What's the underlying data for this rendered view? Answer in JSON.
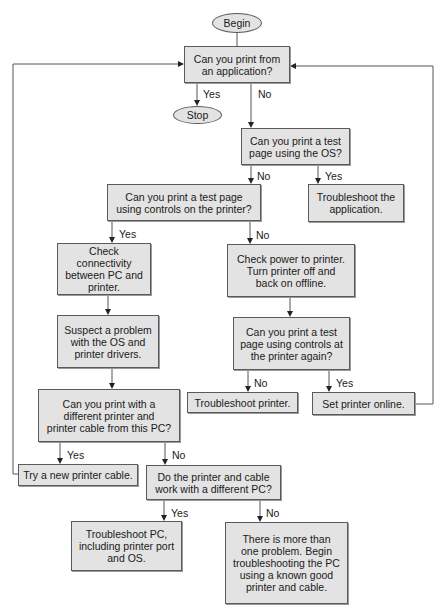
{
  "diagram": {
    "type": "flowchart",
    "colors": {
      "node_fill": "#e3e3e3",
      "node_border": "#5a5a5a",
      "line": "#555555",
      "text": "#1a1a1a"
    },
    "nodes": {
      "begin": "Begin",
      "stop": "Stop",
      "q_app": "Can you print from\nan application?",
      "q_os": "Can you print a test\npage using the OS?",
      "a_troubleshoot_app": "Troubleshoot the\napplication.",
      "q_controls": "Can you print a test page\nusing controls on the printer?",
      "a_check_connectivity": "Check connectivity\nbetween PC and\nprinter.",
      "a_check_power": "Check power to printer.\nTurn printer off and\nback on offline.",
      "a_suspect_os": "Suspect a problem\nwith the OS and\nprinter drivers.",
      "q_controls_again": "Can you print a test\npage using controls at\nthe printer again?",
      "a_troubleshoot_printer": "Troubleshoot printer.",
      "a_set_online": "Set printer online.",
      "q_diff_printer": "Can you print with a\ndifferent printer and\nprinter cable from this PC?",
      "a_new_cable": "Try a new printer cable.",
      "q_diff_pc": "Do the printer and cable\nwork with a different PC?",
      "a_troubleshoot_pc": "Troubleshoot PC,\nincluding printer port\nand OS.",
      "a_more_than_one": "There is more than\none problem. Begin\ntroubleshooting the PC\nusing a known good\nprinter and cable."
    },
    "edge_labels": {
      "app_yes": "Yes",
      "app_no": "No",
      "os_no": "No",
      "os_yes": "Yes",
      "controls_yes": "Yes",
      "controls_no": "No",
      "again_no": "No",
      "again_yes": "Yes",
      "diff_printer_yes": "Yes",
      "diff_printer_no": "No",
      "diff_pc_yes": "Yes",
      "diff_pc_no": "No"
    },
    "edges": [
      {
        "from": "begin",
        "to": "q_app"
      },
      {
        "from": "q_app",
        "to": "stop",
        "label": "Yes"
      },
      {
        "from": "q_app",
        "to": "q_os",
        "label": "No"
      },
      {
        "from": "q_os",
        "to": "q_controls",
        "label": "No"
      },
      {
        "from": "q_os",
        "to": "a_troubleshoot_app",
        "label": "Yes"
      },
      {
        "from": "q_controls",
        "to": "a_check_connectivity",
        "label": "Yes"
      },
      {
        "from": "q_controls",
        "to": "a_check_power",
        "label": "No"
      },
      {
        "from": "a_check_connectivity",
        "to": "a_suspect_os"
      },
      {
        "from": "a_suspect_os",
        "to": "q_diff_printer"
      },
      {
        "from": "a_check_power",
        "to": "q_controls_again"
      },
      {
        "from": "q_controls_again",
        "to": "a_troubleshoot_printer",
        "label": "No"
      },
      {
        "from": "q_controls_again",
        "to": "a_set_online",
        "label": "Yes"
      },
      {
        "from": "a_set_online",
        "to": "q_app"
      },
      {
        "from": "q_diff_printer",
        "to": "a_new_cable",
        "label": "Yes"
      },
      {
        "from": "q_diff_printer",
        "to": "q_diff_pc",
        "label": "No"
      },
      {
        "from": "a_new_cable",
        "to": "q_app"
      },
      {
        "from": "q_diff_pc",
        "to": "a_troubleshoot_pc",
        "label": "Yes"
      },
      {
        "from": "q_diff_pc",
        "to": "a_more_than_one",
        "label": "No"
      }
    ]
  }
}
